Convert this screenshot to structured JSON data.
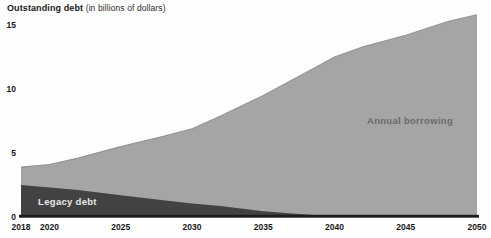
{
  "title": {
    "main": "Outstanding debt",
    "unit": "(in billions of dollars)"
  },
  "chart_data": {
    "type": "area",
    "stacked": true,
    "title": "Outstanding debt (in billions of dollars)",
    "x": [
      2018,
      2020,
      2022,
      2025,
      2028,
      2030,
      2032,
      2035,
      2038,
      2040,
      2042,
      2045,
      2048,
      2050
    ],
    "series": [
      {
        "name": "Legacy debt",
        "color": "#424242",
        "values": [
          2.5,
          2.3,
          2.1,
          1.7,
          1.3,
          1.05,
          0.85,
          0.45,
          0.2,
          0.05,
          0,
          0,
          0,
          0
        ],
        "label": {
          "text": "Legacy debt",
          "year": 2019.2,
          "value": 1.2,
          "anchor": "start",
          "color": "#e9e9e9"
        }
      },
      {
        "name": "Annual borrowing",
        "color": "#a5a5a5",
        "values": [
          1.4,
          1.8,
          2.5,
          3.8,
          5.0,
          5.85,
          7.05,
          9.05,
          11.1,
          12.45,
          13.3,
          14.2,
          15.3,
          15.8
        ],
        "label": {
          "text": "Annual borrowing",
          "year": 2045.3,
          "value": 7.5,
          "anchor": "middle",
          "color": "#6b6b6b"
        }
      }
    ],
    "totals": [
      3.9,
      4.1,
      4.6,
      5.5,
      6.3,
      6.9,
      7.9,
      9.5,
      11.3,
      12.5,
      13.3,
      14.2,
      15.3,
      15.8
    ],
    "x_ticks": [
      2018,
      2020,
      2025,
      2030,
      2035,
      2040,
      2045,
      2050
    ],
    "y_ticks": [
      0,
      5,
      10,
      15
    ],
    "xlim": [
      2018,
      2050
    ],
    "ylim": [
      0,
      15
    ],
    "grid": false,
    "legend": "none (labels drawn inside areas)",
    "axis_color": "#1c1c1c",
    "edge_color": "#959595",
    "tick_label_color": "#161616"
  }
}
